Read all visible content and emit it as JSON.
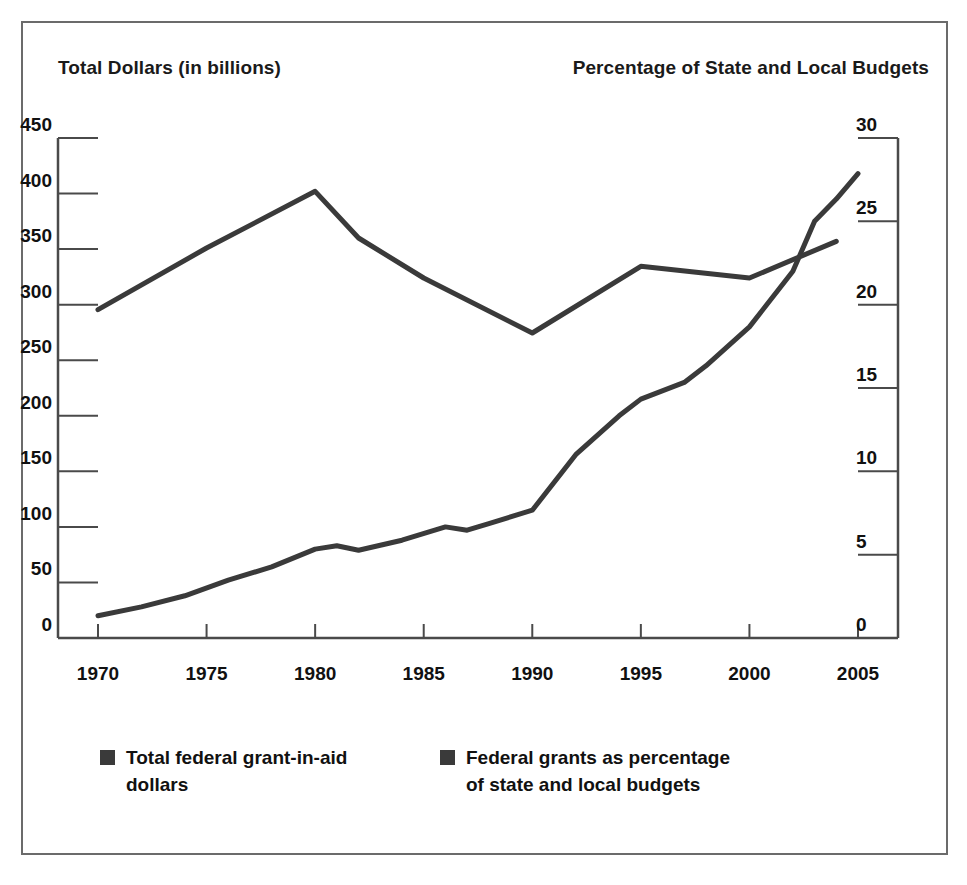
{
  "figure": {
    "left_axis_title": "Total Dollars (in billions)",
    "right_axis_title": "Percentage of State and Local Budgets",
    "border_color": "#6b6b6b",
    "line_color": "#3a3a3a"
  },
  "legend": {
    "items": [
      {
        "label": "Total federal grant-in-aid dollars",
        "swatch_color": "#3a3a3a"
      },
      {
        "label": "Federal grants as percentage of state and local budgets",
        "swatch_color": "#3a3a3a"
      }
    ]
  },
  "chart_data": {
    "type": "line",
    "title": "",
    "subtitle": "",
    "xlabel": "",
    "ylabel": "Total Dollars (in billions)",
    "y2label": "Percentage of State and Local Budgets",
    "xlim": [
      1970,
      2005
    ],
    "ylim": [
      0,
      450
    ],
    "y2lim": [
      0,
      30
    ],
    "grid": false,
    "legend_position": "bottom-left",
    "x_ticks": [
      1970,
      1975,
      1980,
      1985,
      1990,
      1995,
      2000,
      2005
    ],
    "x_tick_labels": [
      "1970",
      "1975",
      "1980",
      "1985",
      "1990",
      "1995",
      "2000",
      "2005"
    ],
    "y_ticks": [
      0,
      50,
      100,
      150,
      200,
      250,
      300,
      350,
      400,
      450
    ],
    "y_tick_labels": [
      "0",
      "50",
      "100",
      "150",
      "200",
      "250",
      "300",
      "350",
      "400",
      "450"
    ],
    "y2_ticks": [
      0,
      5,
      10,
      15,
      20,
      25,
      30
    ],
    "y2_tick_labels": [
      "0",
      "5",
      "10",
      "15",
      "20",
      "25",
      "30"
    ],
    "series": [
      {
        "name": "Total federal grant-in-aid dollars",
        "axis": "left",
        "units": "billions of dollars",
        "color": "#3a3a3a",
        "x": [
          1970,
          1972,
          1974,
          1976,
          1978,
          1980,
          1981,
          1982,
          1984,
          1986,
          1987,
          1988,
          1990,
          1992,
          1994,
          1995,
          1997,
          1998,
          2000,
          2002,
          2003,
          2004,
          2005
        ],
        "values": [
          20,
          28,
          38,
          52,
          64,
          80,
          83,
          79,
          88,
          100,
          97,
          103,
          115,
          165,
          200,
          215,
          230,
          245,
          280,
          330,
          375,
          395,
          418
        ]
      },
      {
        "name": "Federal grants as percentage of state and local budgets",
        "axis": "right",
        "units": "percent",
        "color": "#3a3a3a",
        "x": [
          1970,
          1975,
          1980,
          1982,
          1985,
          1990,
          1995,
          2000,
          2004
        ],
        "values": [
          19.7,
          23.4,
          26.8,
          24.0,
          21.6,
          18.3,
          22.3,
          21.6,
          23.8
        ]
      }
    ]
  }
}
